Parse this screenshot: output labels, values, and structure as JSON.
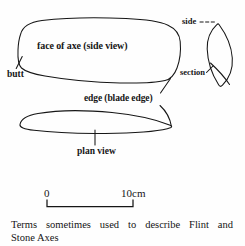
{
  "figure": {
    "title": "Terms sometimes used to describe Flint and Stone Axes",
    "caption_line_1": "Terms sometimes used to describe Flint and",
    "caption_line_2": "Stone Axes",
    "ink_color": "#161616",
    "background_color": "#fefefe"
  },
  "labels": {
    "face": "face of axe (side view)",
    "butt": "butt",
    "edge": "edge (blade edge)",
    "plan": "plan view",
    "side": "side",
    "section": "section"
  },
  "scale_bar": {
    "start_label": "0",
    "end_label": "10cm",
    "length_cm": 10,
    "unit": "cm"
  },
  "diagram_parts": [
    {
      "name": "side-view-outline",
      "description": "rounded elongated blob, face of axe seen from the side"
    },
    {
      "name": "plan-view-outline",
      "description": "elongated leaf shape, rounded butt at left, pointed blade edge at right"
    },
    {
      "name": "section-outline",
      "description": "pointed lens / leaf shape showing the cross section of the axe"
    },
    {
      "name": "butt-leader",
      "description": "leader line from butt label to left end of side view"
    },
    {
      "name": "edge-leader-upper",
      "description": "leader line from edge label to right tip of side view"
    },
    {
      "name": "edge-leader-lower",
      "description": "leader line from edge label to pointed tip of plan view"
    },
    {
      "name": "plan-leader",
      "description": "vertical leader line from plan view outline down to plan view label"
    },
    {
      "name": "side-leader",
      "description": "dashed leader line from side label to the section outline"
    },
    {
      "name": "section-leader",
      "description": "leader line from section label to internal arc of the section outline"
    }
  ]
}
